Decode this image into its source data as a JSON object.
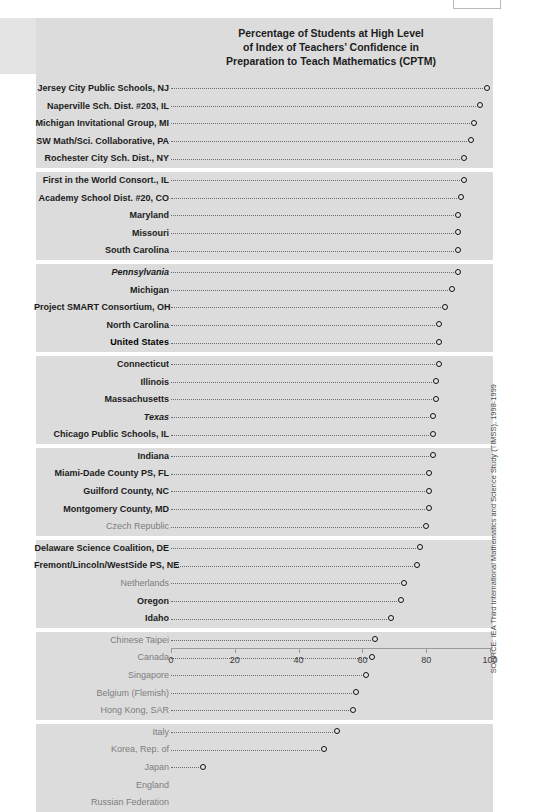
{
  "chart_data": {
    "type": "scatter",
    "title_lines": [
      "Percentage of Students at High Level",
      "of Index of Teachers’ Confidence in",
      "Preparation to Teach Mathematics (CPTM)"
    ],
    "xlabel": "",
    "ylabel": "",
    "xlim": [
      0,
      100
    ],
    "xticks": [
      0,
      20,
      40,
      60,
      80,
      100
    ],
    "xtick_labels": [
      "0",
      "20",
      "40",
      "60",
      "80",
      "100"
    ],
    "grid": false,
    "legend": false,
    "marker_style": "open-circle-with-dotted-leader",
    "categories": [
      "Jersey City Public Schools, NJ",
      "Naperville Sch. Dist. #203, IL",
      "Michigan Invitational Group, MI",
      "SW Math/Sci. Collaborative, PA",
      "Rochester City Sch. Dist., NY",
      "First in the World Consort., IL",
      "Academy School Dist. #20, CO",
      "Maryland",
      "Missouri",
      "South Carolina",
      "Pennsylvania",
      "Michigan",
      "Project SMART Consortium, OH",
      "North Carolina",
      "United States",
      "Connecticut",
      "Illinois",
      "Massachusetts",
      "Texas",
      "Chicago Public Schools, IL",
      "Indiana",
      "Miami-Dade County PS, FL",
      "Guilford County, NC",
      "Montgomery County, MD",
      "Czech Republic",
      "Delaware Science Coalition, DE",
      "Fremont/Lincoln/WestSide PS, NE",
      "Netherlands",
      "Oregon",
      "Idaho",
      "Chinese Taipei",
      "Canada",
      "Singapore",
      "Belgium (Flemish)",
      "Hong Kong, SAR",
      "Italy",
      "Korea, Rep. of",
      "Japan",
      "England",
      "Russian Federation"
    ],
    "values": [
      99,
      97,
      95,
      94,
      92,
      92,
      91,
      90,
      90,
      90,
      90,
      88,
      86,
      84,
      84,
      84,
      83,
      83,
      82,
      82,
      82,
      81,
      81,
      81,
      80,
      78,
      77,
      73,
      72,
      69,
      64,
      63,
      61,
      58,
      57,
      52,
      48,
      10,
      null,
      null
    ]
  },
  "rows": [
    {
      "label": "Jersey City Public Schools, NJ",
      "value": 99,
      "style": "us-district"
    },
    {
      "label": "Naperville Sch. Dist. #203, IL",
      "value": 97,
      "style": "us-district"
    },
    {
      "label": "Michigan Invitational Group, MI",
      "value": 95,
      "style": "us-district"
    },
    {
      "label": "SW Math/Sci. Collaborative, PA",
      "value": 94,
      "style": "us-district"
    },
    {
      "label": "Rochester City Sch. Dist., NY",
      "value": 92,
      "style": "us-district"
    },
    {
      "label": "First in the World Consort., IL",
      "value": 92,
      "style": "us-district"
    },
    {
      "label": "Academy School Dist. #20, CO",
      "value": 91,
      "style": "us-district"
    },
    {
      "label": "Maryland",
      "value": 90,
      "style": "us-state"
    },
    {
      "label": "Missouri",
      "value": 90,
      "style": "us-state"
    },
    {
      "label": "South Carolina",
      "value": 90,
      "style": "us-state"
    },
    {
      "label": "Pennsylvania",
      "value": 90,
      "style": "us-state-italic"
    },
    {
      "label": "Michigan",
      "value": 88,
      "style": "us-state"
    },
    {
      "label": "Project SMART Consortium, OH",
      "value": 86,
      "style": "us-district"
    },
    {
      "label": "North Carolina",
      "value": 84,
      "style": "us-state"
    },
    {
      "label": "United States",
      "value": 84,
      "style": "us-national"
    },
    {
      "label": "Connecticut",
      "value": 84,
      "style": "us-state"
    },
    {
      "label": "Illinois",
      "value": 83,
      "style": "us-state"
    },
    {
      "label": "Massachusetts",
      "value": 83,
      "style": "us-state"
    },
    {
      "label": "Texas",
      "value": 82,
      "style": "us-state-italic"
    },
    {
      "label": "Chicago Public Schools, IL",
      "value": 82,
      "style": "us-district"
    },
    {
      "label": "Indiana",
      "value": 82,
      "style": "us-state"
    },
    {
      "label": "Miami-Dade County PS, FL",
      "value": 81,
      "style": "us-district"
    },
    {
      "label": "Guilford County, NC",
      "value": 81,
      "style": "us-district"
    },
    {
      "label": "Montgomery County, MD",
      "value": 81,
      "style": "us-district"
    },
    {
      "label": "Czech Republic",
      "value": 80,
      "style": "international"
    },
    {
      "label": "Delaware Science Coalition, DE",
      "value": 78,
      "style": "us-district"
    },
    {
      "label": "Fremont/Lincoln/WestSide PS, NE",
      "value": 77,
      "style": "us-district"
    },
    {
      "label": "Netherlands",
      "value": 73,
      "style": "international"
    },
    {
      "label": "Oregon",
      "value": 72,
      "style": "us-state"
    },
    {
      "label": "Idaho",
      "value": 69,
      "style": "us-state"
    },
    {
      "label": "Chinese Taipei",
      "value": 64,
      "style": "international"
    },
    {
      "label": "Canada",
      "value": 63,
      "style": "international"
    },
    {
      "label": "Singapore",
      "value": 61,
      "style": "international"
    },
    {
      "label": "Belgium (Flemish)",
      "value": 58,
      "style": "international"
    },
    {
      "label": "Hong Kong, SAR",
      "value": 57,
      "style": "international"
    },
    {
      "label": "Italy",
      "value": 52,
      "style": "international"
    },
    {
      "label": "Korea, Rep. of",
      "value": 48,
      "style": "international"
    },
    {
      "label": "Japan",
      "value": 10,
      "style": "international"
    },
    {
      "label": "England",
      "value": null,
      "style": "international"
    },
    {
      "label": "Russian Federation",
      "value": null,
      "style": "international"
    }
  ],
  "groups": [
    {
      "start": 0,
      "count": 5
    },
    {
      "start": 5,
      "count": 5
    },
    {
      "start": 10,
      "count": 5
    },
    {
      "start": 15,
      "count": 5
    },
    {
      "start": 20,
      "count": 5
    },
    {
      "start": 25,
      "count": 5
    },
    {
      "start": 30,
      "count": 5
    },
    {
      "start": 35,
      "count": 5
    }
  ],
  "axis": {
    "ticks": [
      0,
      20,
      40,
      60,
      80,
      100
    ],
    "labels": [
      "0",
      "20",
      "40",
      "60",
      "80",
      "100"
    ]
  },
  "source": {
    "text": "SOURCE: IEA Third International Mathematics and Science Study (TIMSS), 1998-1999"
  },
  "colors": {
    "band": "#dcdcdc",
    "marker_stroke": "#111111",
    "leader": "#6a6a6a",
    "label_primary": "#1b1b1b",
    "label_international": "#7d7d7d",
    "axis": "#9a9a9a"
  }
}
